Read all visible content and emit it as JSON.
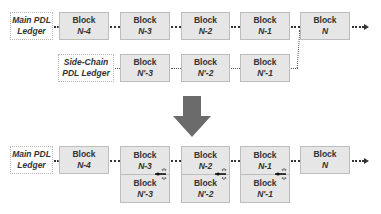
{
  "top": {
    "main_ledger": {
      "line1": "Main PDL",
      "line2": "Ledger"
    },
    "main_blocks": [
      {
        "title": "Block",
        "id": "N-4"
      },
      {
        "title": "Block",
        "id": "N-3"
      },
      {
        "title": "Block",
        "id": "N-2"
      },
      {
        "title": "Block",
        "id": "N-1"
      },
      {
        "title": "Block",
        "id": "N"
      }
    ],
    "side_ledger": {
      "line1": "Side-Chain",
      "line2": "PDL Ledger"
    },
    "side_blocks": [
      {
        "title": "Block",
        "id": "N'-3"
      },
      {
        "title": "Block",
        "id": "N'-2"
      },
      {
        "title": "Block",
        "id": "N'-1"
      }
    ]
  },
  "transition_arrow": {
    "direction": "down",
    "color": "#6b6b6b"
  },
  "bottom": {
    "main_ledger": {
      "line1": "Main PDL",
      "line2": "Ledger"
    },
    "blocks": [
      {
        "title": "Block",
        "id": "N-4"
      },
      {
        "title": "Block",
        "id": "N-3",
        "merged": {
          "title": "Block",
          "id": "N'-3"
        }
      },
      {
        "title": "Block",
        "id": "N-2",
        "merged": {
          "title": "Block",
          "id": "N'-2"
        }
      },
      {
        "title": "Block",
        "id": "N-1",
        "merged": {
          "title": "Block",
          "id": "N'-1"
        }
      },
      {
        "title": "Block",
        "id": "N"
      }
    ],
    "merge_icon": "weld-icon"
  },
  "colors": {
    "block_fill": "#e6e6e6",
    "block_border": "#bdbdbd",
    "text": "#333333",
    "arrow": "#6b6b6b"
  }
}
